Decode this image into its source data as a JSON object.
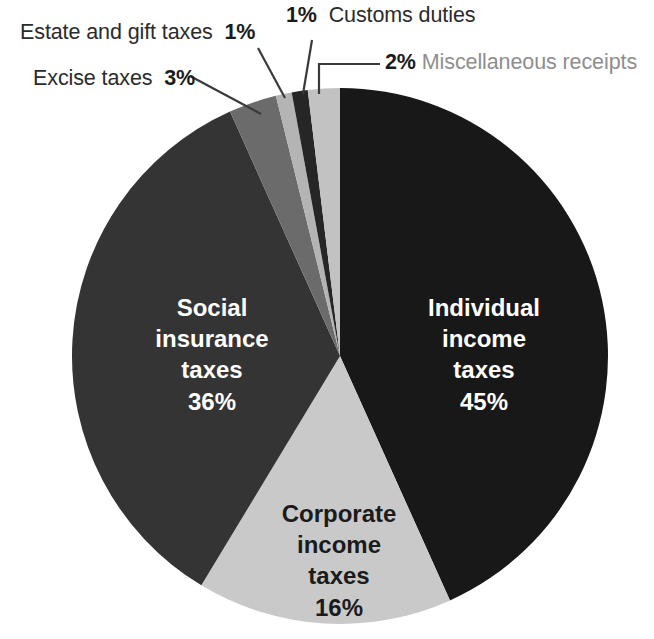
{
  "chart_data": {
    "type": "pie",
    "title": "",
    "subtitle": "",
    "xlabel": "",
    "ylabel": "",
    "units": "percent",
    "total": 104,
    "legend_position": "none",
    "grid": false,
    "start_angle_deg": 0,
    "direction": "clockwise",
    "categories": [
      "Individual income taxes",
      "Corporate income taxes",
      "Social insurance taxes",
      "Excise taxes",
      "Estate and gift taxes",
      "Customs duties",
      "Miscellaneous receipts"
    ],
    "values": [
      45,
      16,
      36,
      3,
      1,
      1,
      2
    ],
    "labels": [
      "45%",
      "16%",
      "36%",
      "3%",
      "1%",
      "1%",
      "2%"
    ],
    "colors": [
      "#181818",
      "#c9c9c9",
      "#343434",
      "#6b6b6b",
      "#b4b4b4",
      "#262626",
      "#c2c2c2"
    ],
    "slices": [
      {
        "name": "Individual income taxes",
        "value": 45,
        "label": "45%",
        "color": "#181818",
        "label_placement": "inside",
        "text_color": "#ffffff"
      },
      {
        "name": "Corporate income taxes",
        "value": 16,
        "label": "16%",
        "color": "#c9c9c9",
        "label_placement": "inside",
        "text_color": "#1b1b1b"
      },
      {
        "name": "Social insurance taxes",
        "value": 36,
        "label": "36%",
        "color": "#343434",
        "label_placement": "inside",
        "text_color": "#ffffff"
      },
      {
        "name": "Excise taxes",
        "value": 3,
        "label": "3%",
        "color": "#6b6b6b",
        "label_placement": "callout",
        "text_color": "#2b2b2b"
      },
      {
        "name": "Estate and gift taxes",
        "value": 1,
        "label": "1%",
        "color": "#b4b4b4",
        "label_placement": "callout",
        "text_color": "#2b2b2b"
      },
      {
        "name": "Customs duties",
        "value": 1,
        "label": "1%",
        "color": "#262626",
        "label_placement": "callout",
        "text_color": "#2b2b2b"
      },
      {
        "name": "Miscellaneous receipts",
        "value": 2,
        "label": "2%",
        "color": "#c2c2c2",
        "label_placement": "callout",
        "text_color": "#8e8e8e"
      }
    ]
  },
  "callouts": {
    "estate": {
      "pct": "1%",
      "name": "Estate and gift taxes"
    },
    "excise": {
      "pct": "3%",
      "name": "Excise taxes"
    },
    "customs": {
      "pct": "1%",
      "name": "Customs duties"
    },
    "misc": {
      "pct": "2%",
      "name": "Miscellaneous receipts"
    }
  },
  "slice_labels": {
    "individual": {
      "l1": "Individual",
      "l2": "income",
      "l3": "taxes",
      "pct": "45%"
    },
    "social": {
      "l1": "Social",
      "l2": "insurance",
      "l3": "taxes",
      "pct": "36%"
    },
    "corporate": {
      "l1": "Corporate",
      "l2": "income",
      "l3": "taxes",
      "pct": "16%"
    }
  },
  "palette": {
    "background": "#ffffff",
    "individual_income_taxes": "#181818",
    "corporate_income_taxes": "#c9c9c9",
    "social_insurance_taxes": "#343434",
    "excise_taxes": "#6b6b6b",
    "estate_and_gift_taxes": "#b4b4b4",
    "customs_duties": "#262626",
    "miscellaneous_receipts": "#c2c2c2",
    "leader_line": "#3a3a3a",
    "label_text": "#2b2b2b",
    "label_text_muted": "#8e8e8e",
    "label_text_on_dark": "#ffffff"
  }
}
